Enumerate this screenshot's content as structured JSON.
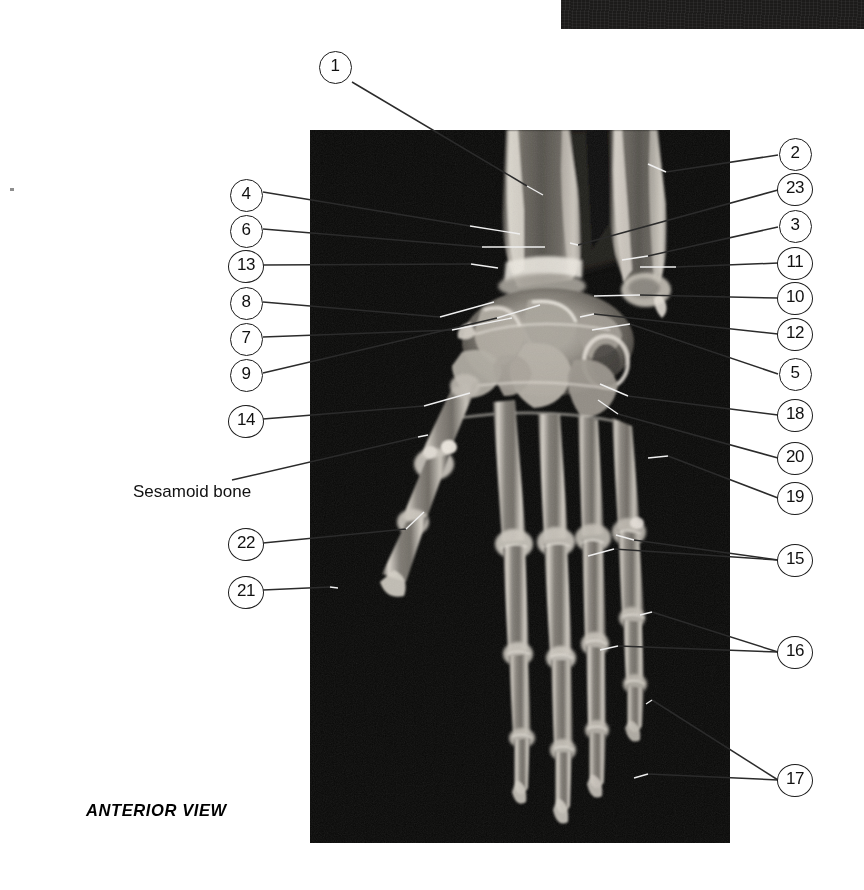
{
  "plate": {
    "view_caption": "ANTERIOR VIEW",
    "panel_label": "hand-and-wrist-radiograph"
  },
  "text_labels": [
    {
      "id": "sesamoid",
      "text": "Sesamoid bone",
      "x": 133,
      "y": 482
    }
  ],
  "callouts_left": [
    {
      "num": "1",
      "x": 334,
      "y": 66
    },
    {
      "num": "4",
      "x": 245,
      "y": 194
    },
    {
      "num": "6",
      "x": 245,
      "y": 230
    },
    {
      "num": "13",
      "x": 245,
      "y": 265
    },
    {
      "num": "8",
      "x": 245,
      "y": 302
    },
    {
      "num": "7",
      "x": 245,
      "y": 338
    },
    {
      "num": "9",
      "x": 245,
      "y": 374
    },
    {
      "num": "14",
      "x": 245,
      "y": 420
    },
    {
      "num": "22",
      "x": 245,
      "y": 543
    },
    {
      "num": "21",
      "x": 245,
      "y": 591
    }
  ],
  "callouts_right": [
    {
      "num": "2",
      "x": 794,
      "y": 153
    },
    {
      "num": "23",
      "x": 794,
      "y": 188
    },
    {
      "num": "3",
      "x": 794,
      "y": 225
    },
    {
      "num": "11",
      "x": 794,
      "y": 262
    },
    {
      "num": "10",
      "x": 794,
      "y": 297
    },
    {
      "num": "12",
      "x": 794,
      "y": 333
    },
    {
      "num": "5",
      "x": 794,
      "y": 373
    },
    {
      "num": "18",
      "x": 794,
      "y": 414
    },
    {
      "num": "20",
      "x": 794,
      "y": 457
    },
    {
      "num": "19",
      "x": 794,
      "y": 497
    },
    {
      "num": "15",
      "x": 794,
      "y": 559
    },
    {
      "num": "16",
      "x": 794,
      "y": 651
    },
    {
      "num": "17",
      "x": 794,
      "y": 779
    }
  ],
  "leader_lines": {
    "outside": [
      "M352,82 L527,186",
      "M263,192 L470,226",
      "M263,229 L482,247",
      "M263,265 L471,264",
      "M263,302 L440,317",
      "M263,337 L452,330",
      "M263,373 L497,318",
      "M263,419 L424,406",
      "M232,480 L418,437",
      "M263,543 L406,529",
      "M263,590 L330,587",
      "M778,155 L666,172",
      "M778,190 L578,245",
      "M778,227 L648,256",
      "M778,263 L676,267",
      "M778,298 L640,295",
      "M778,334 L594,314",
      "M778,374 L630,324",
      "M778,415 L628,396",
      "M778,458 L618,414",
      "M778,498 L668,456",
      "M778,560 L634,540",
      "M778,560 L614,549",
      "M778,652 L652,612",
      "M778,652 L618,646",
      "M778,780 L648,774",
      "M778,780 L652,700"
    ],
    "inside": [
      "M527,186 L543,195",
      "M470,226 L520,234",
      "M482,247 L545,247",
      "M471,264 L498,268",
      "M440,317 L494,302",
      "M452,330 L512,318",
      "M497,318 L540,305",
      "M424,406 L470,393",
      "M418,437 L428,435",
      "M406,529 L424,512",
      "M330,587 L338,588",
      "M666,172 L648,164",
      "M578,245 L570,243",
      "M648,256 L622,260",
      "M676,267 L640,267",
      "M640,295 L594,296",
      "M594,314 L580,317",
      "M630,324 L592,330",
      "M628,396 L600,384",
      "M618,414 L598,400",
      "M668,456 L648,458",
      "M634,540 L616,535",
      "M614,549 L588,556",
      "M652,612 L640,615",
      "M618,646 L600,650",
      "M648,774 L634,778",
      "M652,700 L646,704"
    ]
  }
}
